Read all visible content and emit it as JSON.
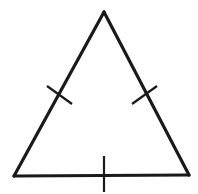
{
  "figure": {
    "kind": "geometry-diagram",
    "shape_name": "triangle",
    "background_color": "#ffffff",
    "stroke_color": "#1a1a1a",
    "tick_color": "#1a1a1a",
    "side_stroke_width": 3.2,
    "tick_stroke_width": 2.2,
    "canvas": {
      "width": 198,
      "height": 194
    },
    "vertices": [
      {
        "label": "apex",
        "x": 104,
        "y": 12
      },
      {
        "label": "bottom-right",
        "x": 189,
        "y": 175
      },
      {
        "label": "bottom-left",
        "x": 14,
        "y": 176
      }
    ],
    "polygon_points": "104,12 189,175 14,176",
    "sides": [
      {
        "name": "left-side",
        "from": "apex",
        "to": "bottom-left",
        "x1": 104,
        "y1": 12,
        "x2": 14,
        "y2": 176,
        "tick_count": 1
      },
      {
        "name": "right-side",
        "from": "apex",
        "to": "bottom-right",
        "x1": 104,
        "y1": 12,
        "x2": 189,
        "y2": 175,
        "tick_count": 1
      },
      {
        "name": "base-side",
        "from": "bottom-left",
        "to": "bottom-right",
        "x1": 14,
        "y1": 176,
        "x2": 189,
        "y2": 175,
        "tick_count": 1
      }
    ],
    "tick_marks": [
      {
        "name": "left-side-tick",
        "on_side": "left-side",
        "x1": 47,
        "y1": 86,
        "x2": 72,
        "y2": 104
      },
      {
        "name": "right-side-tick",
        "on_side": "right-side",
        "x1": 132,
        "y1": 104,
        "x2": 157,
        "y2": 86
      },
      {
        "name": "base-side-tick",
        "on_side": "base-side",
        "x1": 104,
        "y1": 156,
        "x2": 104,
        "y2": 192
      }
    ],
    "annotations": []
  }
}
